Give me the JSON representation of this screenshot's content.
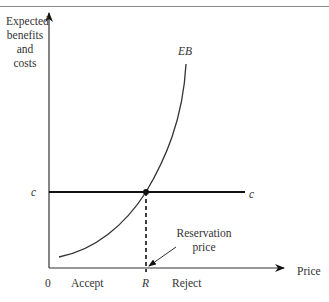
{
  "header": {
    "cut_text": "...Chapter ... Strategy"
  },
  "diagram": {
    "y_axis_label": [
      "Expected",
      "benefits",
      "and",
      "costs"
    ],
    "x_axis_label": "Price",
    "origin_label": "0",
    "curve_label": "EB",
    "cost_label_left": "c",
    "cost_label_right": "c",
    "r_label": "R",
    "accept_label": "Accept",
    "reject_label": "Reject",
    "annotation": [
      "Reservation",
      "price"
    ]
  }
}
